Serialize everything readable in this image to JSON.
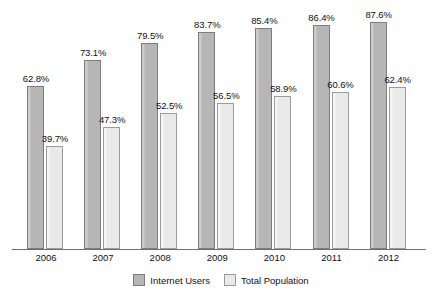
{
  "chart_data": {
    "type": "bar",
    "title": "",
    "subtitle": "",
    "xlabel": "",
    "ylabel": "",
    "categories": [
      "2006",
      "2007",
      "2008",
      "2009",
      "2010",
      "2011",
      "2012"
    ],
    "series": [
      {
        "name": "Internet Users",
        "color": "#b6b6b6",
        "border_color": "#7d7d7d",
        "values": [
          62.8,
          73.1,
          79.5,
          83.7,
          85.4,
          86.4,
          87.6
        ],
        "labels": [
          "62.8%",
          "73.1%",
          "79.5%",
          "83.7%",
          "85.4%",
          "86.4%",
          "87.6%"
        ]
      },
      {
        "name": "Total Population",
        "color": "#e9e9e9",
        "border_color": "#9b9b9b",
        "values": [
          39.7,
          47.3,
          52.5,
          56.5,
          58.9,
          60.6,
          62.4
        ],
        "labels": [
          "39.7%",
          "47.3%",
          "52.5%",
          "56.5%",
          "58.9%",
          "60.6%",
          "62.4%"
        ]
      }
    ],
    "ylim": [
      0,
      96.5
    ],
    "grid": false,
    "legend_position": "bottom",
    "value_labels_shown": true,
    "axis_color": "#6f6f6f",
    "background_color": "#ffffff"
  }
}
